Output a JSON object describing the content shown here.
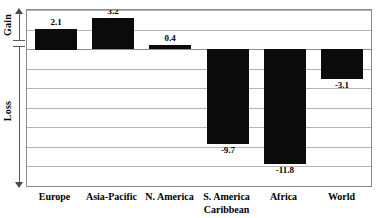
{
  "chart_data": {
    "type": "bar",
    "title": "",
    "subtitle": "",
    "xlabel": "",
    "ylabel": "",
    "categories": [
      "Europe",
      "Asia-Pacific",
      "N. America",
      "S. America\nCaribbean",
      "Africa",
      "World"
    ],
    "values": [
      2.1,
      3.2,
      0.4,
      -9.7,
      -11.8,
      -3.1
    ],
    "value_labels": [
      "2.1",
      "3.2",
      "0.4",
      "-9.7",
      "-11.8",
      "-3.1"
    ],
    "ylim": [
      -14,
      4
    ],
    "grid": true,
    "gridlines": [
      4,
      2,
      0,
      -2,
      -4,
      -6,
      -8,
      -10,
      -12,
      -14
    ],
    "legend": "none",
    "legend_position": "none",
    "bar_color": "#0b0b0b",
    "gridline_color": "#b3b3b3",
    "axis_color": "#8a8a8a",
    "annotations": []
  },
  "y_axis": {
    "gain_label": "Gain",
    "loss_label": "Loss",
    "gain_icon": "arrow-up-icon",
    "loss_icon": "arrow-down-icon"
  }
}
